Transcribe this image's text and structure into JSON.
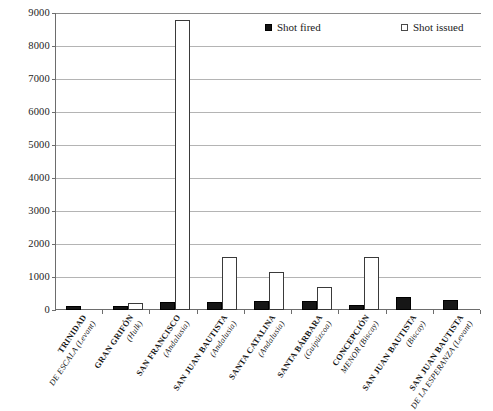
{
  "chart_data": {
    "type": "bar",
    "title": "",
    "xlabel": "",
    "ylabel": "",
    "ylim": [
      0,
      9000
    ],
    "ytick_step": 1000,
    "yticks": [
      "0",
      "1000",
      "2000",
      "3000",
      "4000",
      "5000",
      "6000",
      "7000",
      "8000",
      "9000"
    ],
    "grid": true,
    "legend_position": "top-right",
    "categories": [
      "TRINIDAD DE ESCALA (Levant)",
      "GRAN GRIFÓN (Hulk)",
      "SAN FRANCISCO (Andalusia)",
      "SAN JUAN BAUTISTA (Andalusia)",
      "SANTA CATALINA (Andalusia)",
      "SANTA BÁRBARA (Guipúzcoa)",
      "CONCEPCIÓN MENOR (Biscay)",
      "SAN JUAN BAUTISTA (Biscay)",
      "SAN JUAN BAUTISTA DE LA ESPERANZA (Levant)"
    ],
    "category_lines": [
      {
        "name": "TRINIDAD",
        "qualifier": "DE ESCALA (Levant)"
      },
      {
        "name": "GRAN GRIFÓN",
        "qualifier": "(Hulk)"
      },
      {
        "name": "SAN FRANCISCO",
        "qualifier": "(Andalusia)"
      },
      {
        "name": "SAN JUAN BAUTISTA",
        "qualifier": "(Andalusia)"
      },
      {
        "name": "SANTA CATALINA",
        "qualifier": "(Andalusia)"
      },
      {
        "name": "SANTA BÁRBARA",
        "qualifier": "(Guipúzcoa)"
      },
      {
        "name": "CONCEPCIÓN",
        "qualifier": "MENOR (Biscay)"
      },
      {
        "name": "SAN JUAN BAUTISTA",
        "qualifier": "(Biscay)"
      },
      {
        "name": "SAN JUAN BAUTISTA",
        "qualifier": "DE LA ESPERANZA (Levant)"
      }
    ],
    "series": [
      {
        "name": "Shot fired",
        "color": "#161616",
        "style": "filled",
        "values": [
          130,
          120,
          230,
          230,
          260,
          270,
          160,
          380,
          310
        ]
      },
      {
        "name": "Shot issued",
        "color": "#ffffff",
        "style": "hollow",
        "values": [
          0,
          200,
          8800,
          1600,
          1150,
          700,
          1600,
          0,
          0
        ]
      }
    ]
  },
  "legend": {
    "entries": [
      {
        "label": "Shot fired",
        "style": "filled"
      },
      {
        "label": "Shot issued",
        "style": "hollow"
      }
    ]
  }
}
